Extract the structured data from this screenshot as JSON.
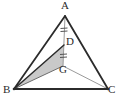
{
  "figure": {
    "type": "geometry-diagram",
    "background_color": "#ffffff",
    "stroke_color": "#2b2b2b",
    "thin_stroke_color": "#8a8a8a",
    "shade_color": "#c9c9c9",
    "labels": {
      "a": "A",
      "b": "B",
      "c": "C",
      "d": "D",
      "g": "G"
    },
    "points": {
      "A": {
        "x": 65,
        "y": 16
      },
      "B": {
        "x": 14,
        "y": 89
      },
      "C": {
        "x": 108,
        "y": 89
      },
      "D": {
        "x": 64,
        "y": 45
      },
      "G": {
        "x": 63,
        "y": 66
      }
    },
    "label_positions": {
      "A": {
        "x": 61,
        "y": 1
      },
      "B": {
        "x": 4,
        "y": 85
      },
      "C": {
        "x": 108,
        "y": 85
      },
      "D": {
        "x": 66,
        "y": 36
      },
      "G": {
        "x": 60,
        "y": 65
      }
    },
    "segments": [
      {
        "name": "AB",
        "from": "A",
        "to": "B",
        "style": "thick"
      },
      {
        "name": "AC",
        "from": "A",
        "to": "C",
        "style": "thick"
      },
      {
        "name": "BC",
        "from": "B",
        "to": "C",
        "style": "thick"
      },
      {
        "name": "AG",
        "from": "A",
        "to": "G",
        "style": "thin"
      },
      {
        "name": "BD",
        "from": "B",
        "to": "D",
        "style": "thick"
      },
      {
        "name": "BG",
        "from": "B",
        "to": "G",
        "style": "thin"
      },
      {
        "name": "GC",
        "from": "G",
        "to": "C",
        "style": "thin"
      }
    ],
    "shaded_region": {
      "name": "triangle-BDG",
      "vertices": [
        "B",
        "D",
        "G"
      ],
      "fill": "#c9c9c9"
    },
    "tick_marks": [
      {
        "name": "tick-AD",
        "on_segment": "AD",
        "count": 2,
        "position": {
          "x": 64,
          "y": 30
        }
      },
      {
        "name": "tick-DG",
        "on_segment": "DG",
        "count": 2,
        "position": {
          "x": 64,
          "y": 56
        }
      }
    ]
  }
}
